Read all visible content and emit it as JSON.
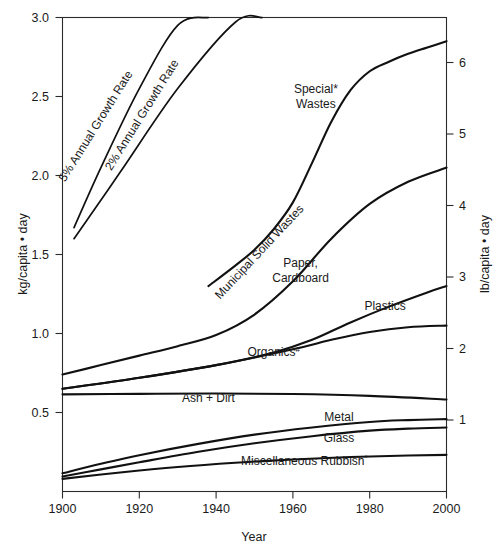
{
  "figure": {
    "background": "#ffffff",
    "line_color": "#111111",
    "axis_color": "#2b2b2b"
  },
  "chart_data": {
    "type": "line",
    "title": "",
    "xlabel": "Year",
    "ylabel": "kg/capita • day",
    "ylabel_right": "lb/capita • day",
    "xlim": [
      1900,
      2000
    ],
    "ylim": [
      0.0,
      3.0
    ],
    "ylim_right": [
      0.0,
      6.6139
    ],
    "grid": false,
    "legend": "inline-annotations",
    "xticks": [
      1900,
      1920,
      1940,
      1960,
      1980,
      2000
    ],
    "xticklabels": [
      "1900",
      "1920",
      "1940",
      "1960",
      "1980",
      "2000"
    ],
    "yticks": [
      0.5,
      1.0,
      1.5,
      2.0,
      2.5,
      3.0
    ],
    "yticklabels": [
      "0.5",
      "1.0",
      "1.5",
      "2.0",
      "2.5",
      "3.0"
    ],
    "yticks_right": [
      1,
      2,
      3,
      4,
      5,
      6
    ],
    "yticklabels_right": [
      "1",
      "2",
      "3",
      "4",
      "5",
      "6"
    ],
    "series": [
      {
        "name": "5% Annual Growth Rate",
        "label": "5% Annual Growth Rate",
        "label_rotation": -58,
        "label_x": 1909.5,
        "label_y": 2.3,
        "x": [
          1903,
          1910,
          1920,
          1930,
          1938
        ],
        "values": [
          1.67,
          2.05,
          2.55,
          2.95,
          3.0
        ]
      },
      {
        "name": "2% Annual Growth Rate",
        "label": "2% Annual Growth Rate",
        "label_rotation": -58,
        "label_x": 1921.5,
        "label_y": 2.37,
        "x": [
          1903,
          1915,
          1930,
          1945,
          1952
        ],
        "values": [
          1.6,
          2.02,
          2.55,
          2.97,
          3.0
        ]
      },
      {
        "name": "Special Wastes",
        "label": "Special*",
        "label2": "Wastes",
        "label_x": 1966,
        "label_y": 2.52,
        "x": [
          1938,
          1945,
          1950,
          1955,
          1960,
          1965,
          1970,
          1975,
          1980,
          1985,
          1990,
          1995,
          2000
        ],
        "values": [
          1.3,
          1.43,
          1.53,
          1.66,
          1.83,
          2.08,
          2.34,
          2.54,
          2.66,
          2.72,
          2.77,
          2.81,
          2.85
        ]
      },
      {
        "name": "Paper, Cardboard",
        "label": "Paper,",
        "label2": "Cardboard",
        "label_x": 1962,
        "label_y": 1.42,
        "x": [
          1900,
          1910,
          1920,
          1930,
          1940,
          1950,
          1960,
          1970,
          1980,
          1990,
          2000
        ],
        "values": [
          0.74,
          0.8,
          0.86,
          0.92,
          0.99,
          1.12,
          1.33,
          1.6,
          1.82,
          1.96,
          2.05
        ]
      },
      {
        "name": "Plastics",
        "label": "Plastics",
        "label_x": 1984,
        "label_y": 1.15,
        "x": [
          1900,
          1920,
          1940,
          1955,
          1965,
          1975,
          1985,
          1995,
          2000
        ],
        "values": [
          0.65,
          0.72,
          0.8,
          0.88,
          0.96,
          1.07,
          1.17,
          1.26,
          1.3
        ]
      },
      {
        "name": "Organics",
        "label": "Organics",
        "label_sup": "#",
        "label_x": 1955,
        "label_y": 0.855,
        "x": [
          1900,
          1920,
          1940,
          1960,
          1970,
          1980,
          1990,
          2000
        ],
        "values": [
          0.65,
          0.72,
          0.8,
          0.9,
          0.96,
          1.01,
          1.04,
          1.05
        ]
      },
      {
        "name": "Ash + Dirt",
        "label": "Ash + Dirt",
        "label_x": 1938,
        "label_y": 0.565,
        "x": [
          1900,
          1920,
          1940,
          1960,
          1980,
          2000
        ],
        "values": [
          0.615,
          0.618,
          0.62,
          0.617,
          0.605,
          0.582
        ]
      },
      {
        "name": "Metal",
        "label": "Metal",
        "label_x": 1972,
        "label_y": 0.445,
        "x": [
          1900,
          1910,
          1920,
          1935,
          1950,
          1965,
          1980,
          1990,
          2000
        ],
        "values": [
          0.115,
          0.175,
          0.23,
          0.3,
          0.36,
          0.405,
          0.44,
          0.452,
          0.458
        ]
      },
      {
        "name": "Glass",
        "label": "Glass",
        "label_x": 1972,
        "label_y": 0.315,
        "x": [
          1900,
          1910,
          1920,
          1935,
          1950,
          1965,
          1980,
          1990,
          2000
        ],
        "values": [
          0.095,
          0.14,
          0.185,
          0.25,
          0.305,
          0.35,
          0.385,
          0.398,
          0.405
        ]
      },
      {
        "name": "Miscellaneous Rubbish",
        "label": "Miscellaneous Rubbish",
        "label_sup": "°",
        "label_x": 1963,
        "label_y": 0.165,
        "x": [
          1900,
          1915,
          1930,
          1945,
          1960,
          1975,
          1990,
          2000
        ],
        "values": [
          0.08,
          0.12,
          0.155,
          0.182,
          0.203,
          0.218,
          0.228,
          0.232
        ]
      }
    ],
    "annotations": [
      {
        "text": "5% Annual Growth Rate",
        "kind": "rotated-series-label"
      },
      {
        "text": "2% Annual Growth Rate",
        "kind": "rotated-series-label"
      },
      {
        "text": "Special*",
        "kind": "series-label"
      },
      {
        "text": "Wastes",
        "kind": "series-label"
      },
      {
        "text": "Municipal Solid Wastes",
        "kind": "rotated-series-label"
      },
      {
        "text": "Paper,",
        "kind": "series-label"
      },
      {
        "text": "Cardboard",
        "kind": "series-label"
      },
      {
        "text": "Plastics",
        "kind": "series-label"
      },
      {
        "text": "Organics#",
        "kind": "series-label"
      },
      {
        "text": "Ash + Dirt",
        "kind": "series-label"
      },
      {
        "text": "Metal",
        "kind": "series-label"
      },
      {
        "text": "Glass",
        "kind": "series-label"
      },
      {
        "text": "Miscellaneous Rubbish°",
        "kind": "series-label"
      }
    ]
  },
  "labels": {
    "msw": "Municipal Solid Wastes",
    "msw_rotation": -47,
    "msw_x": 1952,
    "msw_y": 1.5
  }
}
